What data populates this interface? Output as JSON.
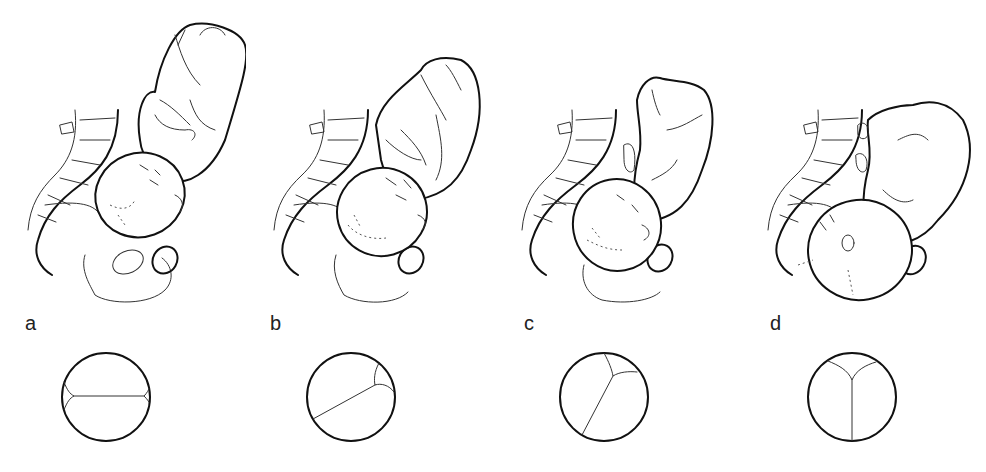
{
  "figure": {
    "panels": [
      {
        "label": "a",
        "stage": "head-flexed-transverse",
        "suture": "transverse sagittal suture with both fontanelles at sides"
      },
      {
        "label": "b",
        "stage": "head-rotating-oblique",
        "suture": "oblique sagittal suture, posterior fontanelle upper right"
      },
      {
        "label": "c",
        "stage": "head-rotating-further",
        "suture": "steeper oblique sagittal suture, posterior fontanelle near top"
      },
      {
        "label": "d",
        "stage": "head-anteroposterior",
        "suture": "vertical sagittal suture, Y-shaped posterior fontanelle at top"
      }
    ],
    "colors": {
      "ink": "#111111",
      "background": "#ffffff",
      "label": "#222222"
    }
  }
}
